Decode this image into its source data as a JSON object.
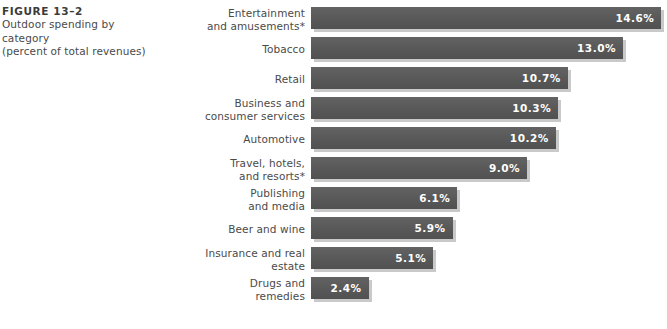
{
  "caption": {
    "figure_label": "FIGURE 13–2",
    "line1": "Outdoor spending by category",
    "line2": "(percent of total revenues)"
  },
  "chart_data": {
    "type": "bar",
    "orientation": "horizontal",
    "title": "Outdoor spending by category (percent of total revenues)",
    "figure_number": "FIGURE 13–2",
    "xlabel": "",
    "ylabel": "",
    "xlim": [
      0,
      14.6
    ],
    "grid": false,
    "legend": null,
    "value_suffix": "%",
    "categories": [
      "Entertainment\nand amusements*",
      "Tobacco",
      "Retail",
      "Business and\nconsumer services",
      "Automotive",
      "Travel, hotels,\nand resorts*",
      "Publishing\nand media",
      "Beer and wine",
      "Insurance and real\nestate",
      "Drugs and\nremedies"
    ],
    "values": [
      14.6,
      13.0,
      10.7,
      10.3,
      10.2,
      9.0,
      6.1,
      5.9,
      5.1,
      2.4
    ],
    "value_labels": [
      "14.6%",
      "13.0%",
      "10.7%",
      "10.3%",
      "10.2%",
      "9.0%",
      "6.1%",
      "5.9%",
      "5.1%",
      "2.4%"
    ],
    "bars": [
      {
        "label": "Entertainment\nand amusements*",
        "value": 14.6,
        "value_label": "14.6%"
      },
      {
        "label": "Tobacco",
        "value": 13.0,
        "value_label": "13.0%"
      },
      {
        "label": "Retail",
        "value": 10.7,
        "value_label": "10.7%"
      },
      {
        "label": "Business and\nconsumer services",
        "value": 10.3,
        "value_label": "10.3%"
      },
      {
        "label": "Automotive",
        "value": 10.2,
        "value_label": "10.2%"
      },
      {
        "label": "Travel, hotels,\nand resorts*",
        "value": 9.0,
        "value_label": "9.0%"
      },
      {
        "label": "Publishing\nand media",
        "value": 6.1,
        "value_label": "6.1%"
      },
      {
        "label": "Beer and wine",
        "value": 5.9,
        "value_label": "5.9%"
      },
      {
        "label": "Insurance and real\nestate",
        "value": 5.1,
        "value_label": "5.1%"
      },
      {
        "label": "Drugs and\nremedies",
        "value": 2.4,
        "value_label": "2.4%"
      }
    ],
    "colors": {
      "bar": "#5d5d5d",
      "bar_shadow": "#c9c9c9",
      "value_text": "#ffffff",
      "label_text": "#4a4a4a",
      "background": "#ffffff"
    }
  },
  "layout": {
    "bar_origin_x": 311,
    "px_per_percent": 24,
    "row_pitch": 30,
    "first_row_top": 4
  }
}
